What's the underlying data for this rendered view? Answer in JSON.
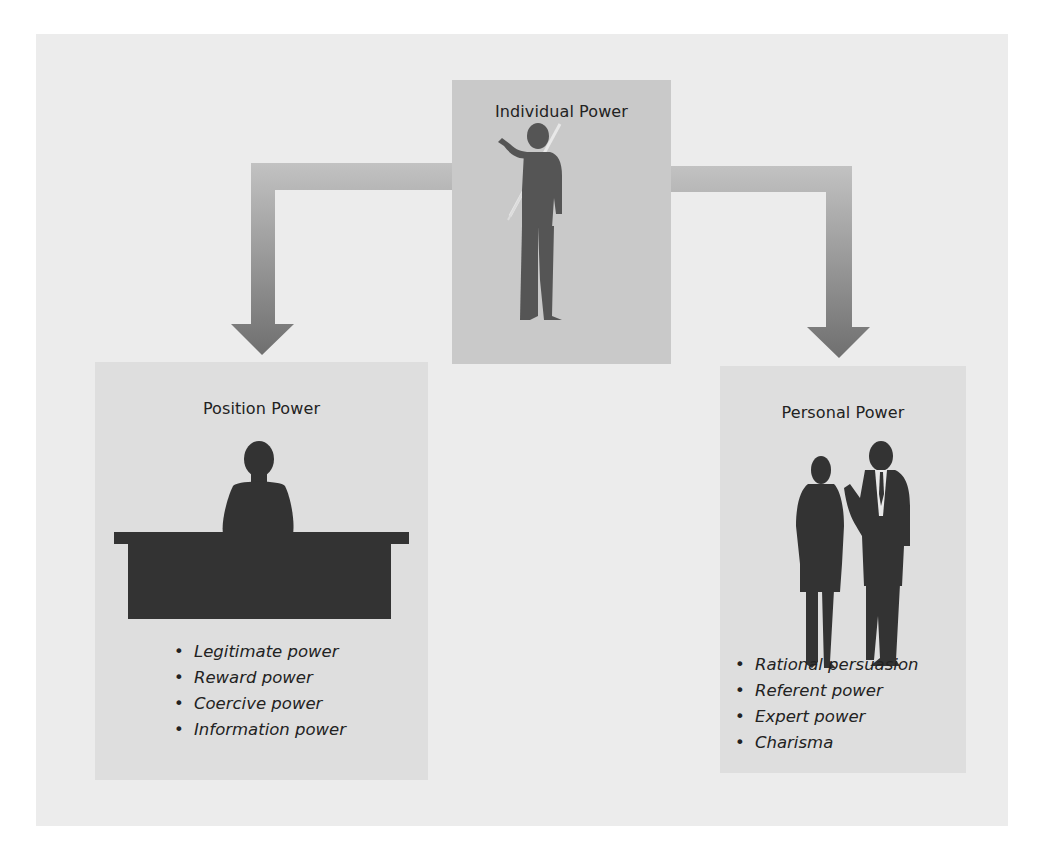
{
  "diagram": {
    "top": {
      "title": "Individual Power",
      "figure": "person-with-pointer-icon"
    },
    "left": {
      "title": "Position Power",
      "figure": "person-at-desk-icon",
      "items": [
        "Legitimate power",
        "Reward power",
        "Coercive power",
        "Information power"
      ]
    },
    "right": {
      "title": "Personal Power",
      "figure": "two-people-talking-icon",
      "items": [
        "Rational persuasion",
        "Referent power",
        "Expert power",
        "Charisma"
      ]
    },
    "arrows": [
      {
        "from": "Individual Power",
        "to": "Position Power"
      },
      {
        "from": "Individual Power",
        "to": "Personal Power"
      }
    ],
    "colors": {
      "frame": "#ececec",
      "top_box": "#c9c9c9",
      "side_box": "#dedede",
      "silhouette": "#3a3a3a",
      "arrow_light": "#c4c4c4",
      "arrow_dark": "#777777"
    }
  }
}
